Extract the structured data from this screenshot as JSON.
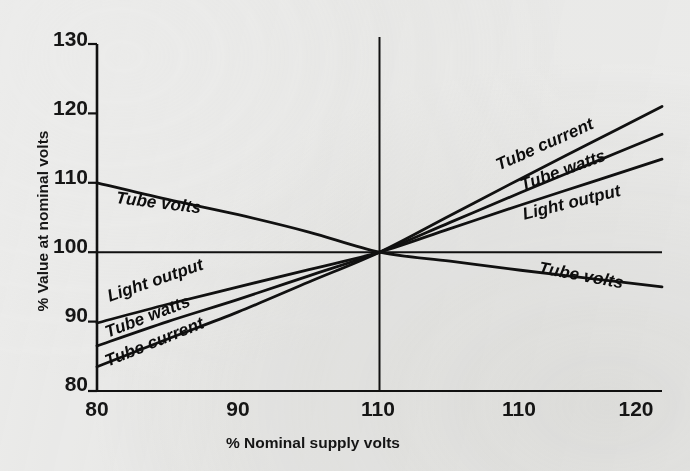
{
  "figure": {
    "background_color": "#ececeb",
    "ink_color": "#111111"
  },
  "chart_data": {
    "type": "line",
    "title": "",
    "xlabel": "% Nominal supply volts",
    "ylabel": "% Value at nominal volts",
    "xlim": [
      80,
      120
    ],
    "ylim": [
      80,
      130
    ],
    "x_tick_labels": [
      "80",
      "90",
      "110",
      "110",
      "120"
    ],
    "x_tick_values": [
      80,
      90,
      100,
      110,
      120
    ],
    "y_tick_labels": [
      "80",
      "90",
      "100",
      "110",
      "120",
      "130"
    ],
    "y_tick_values": [
      80,
      90,
      100,
      110,
      120,
      130
    ],
    "grid": false,
    "legend": "inline-along-curves",
    "reference_lines": {
      "horizontal_at_y": 100,
      "vertical_at_x": 100
    },
    "note": "All curves converge at the nominal operating point (100% supply volts, 100% value). The third x tick is printed as 110 in the original figure though it marks 100.",
    "series": [
      {
        "name": "Tube current",
        "label": "Tube current",
        "x": [
          80,
          85,
          90,
          95,
          100,
          105,
          110,
          115,
          120
        ],
        "values": [
          83.5,
          87.5,
          91.4,
          95.7,
          100.0,
          105.3,
          110.6,
          115.8,
          121.0
        ]
      },
      {
        "name": "Tube watts",
        "label": "Tube watts",
        "x": [
          80,
          85,
          90,
          95,
          100,
          105,
          110,
          115,
          120
        ],
        "values": [
          86.5,
          90.0,
          93.2,
          96.6,
          100.0,
          104.3,
          108.6,
          112.8,
          117.0
        ]
      },
      {
        "name": "Light output",
        "label": "Light output",
        "x": [
          80,
          85,
          90,
          95,
          100,
          105,
          110,
          115,
          120
        ],
        "values": [
          89.8,
          92.5,
          95.0,
          97.5,
          100.0,
          103.4,
          106.8,
          110.1,
          113.4
        ]
      },
      {
        "name": "Tube volts",
        "label": "Tube volts",
        "x": [
          80,
          85,
          90,
          95,
          100,
          105,
          110,
          115,
          120
        ],
        "values": [
          110.0,
          107.6,
          105.4,
          102.9,
          100.0,
          98.7,
          97.4,
          96.2,
          95.0
        ]
      }
    ],
    "curve_labels": [
      {
        "text": "Tube volts",
        "side": "left"
      },
      {
        "text": "Light output",
        "side": "left"
      },
      {
        "text": "Tube watts",
        "side": "left"
      },
      {
        "text": "Tube current",
        "side": "left"
      },
      {
        "text": "Tube current",
        "side": "right"
      },
      {
        "text": "Tube watts",
        "side": "right"
      },
      {
        "text": "Light output",
        "side": "right"
      },
      {
        "text": "Tube volts",
        "side": "right"
      }
    ]
  },
  "ghost_text": {
    "a": "",
    "b": "",
    "c": "",
    "d": "",
    "e": ""
  }
}
